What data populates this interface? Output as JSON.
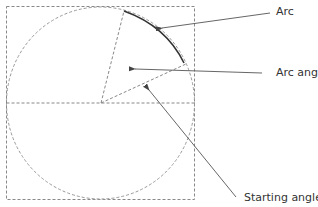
{
  "diagram": {
    "type": "arc-geometry",
    "labels": {
      "arc": "Arc",
      "arc_angle": "Arc angle",
      "starting_angle": "Starting angle"
    },
    "colors": {
      "guide": "#888888",
      "arc": "#333333",
      "leader": "#555555",
      "text": "#333333"
    }
  }
}
